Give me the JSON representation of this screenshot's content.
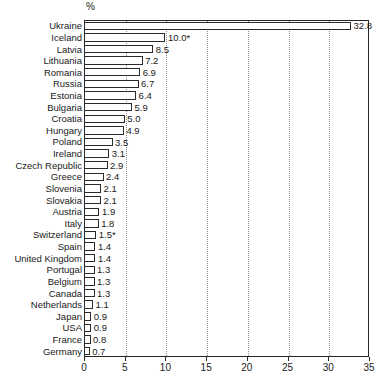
{
  "chart_data": {
    "type": "bar",
    "orientation": "horizontal",
    "title": "",
    "subtitle": "",
    "unit_label": "%",
    "xlabel": "",
    "ylabel": "",
    "xlim": [
      0,
      35
    ],
    "xticks": [
      0,
      5,
      10,
      15,
      20,
      25,
      30,
      35
    ],
    "xtick_labels": [
      "0",
      "5",
      "10",
      "15",
      "20",
      "25",
      "30",
      "35"
    ],
    "grid": true,
    "grid_axis": "x",
    "grid_style": "dotted",
    "legend": false,
    "bar_fill": "#ffffff",
    "bar_edge": "#2b2b2b",
    "categories": [
      "Ukraine",
      "Iceland",
      "Latvia",
      "Lithuania",
      "Romania",
      "Russia",
      "Estonia",
      "Bulgaria",
      "Croatia",
      "Hungary",
      "Poland",
      "Ireland",
      "Czech Republic",
      "Greece",
      "Slovenia",
      "Slovakia",
      "Austria",
      "Italy",
      "Switzerland",
      "Spain",
      "United Kingdom",
      "Portugal",
      "Belgium",
      "Canada",
      "Netherlands",
      "Japan",
      "USA",
      "France",
      "Germany"
    ],
    "values": [
      32.8,
      10.0,
      8.5,
      7.2,
      6.9,
      6.7,
      6.4,
      5.9,
      5.0,
      4.9,
      3.5,
      3.1,
      2.9,
      2.4,
      2.1,
      2.1,
      1.9,
      1.8,
      1.5,
      1.4,
      1.4,
      1.3,
      1.3,
      1.3,
      1.1,
      0.9,
      0.9,
      0.8,
      0.7
    ],
    "value_labels": [
      "32.8",
      "10.0*",
      "8.5",
      "7.2",
      "6.9",
      "6.7",
      "6.4",
      "5.9",
      "5.0",
      "4.9",
      "3.5",
      "3.1",
      "2.9",
      "2.4",
      "2.1",
      "2.1",
      "1.9",
      "1.8",
      "1.5*",
      "1.4",
      "1.4",
      "1.3",
      "1.3",
      "1.3",
      "1.1",
      "0.9",
      "0.9",
      "0.8",
      "0.7"
    ]
  }
}
